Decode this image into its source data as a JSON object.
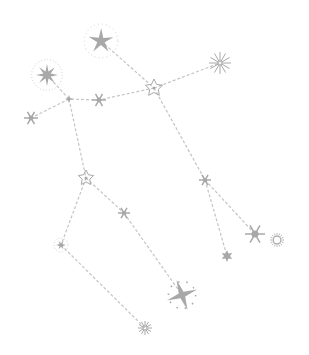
{
  "diagram": {
    "title": "",
    "colors": {
      "background": "#ffffff",
      "star": "#a8a8a8",
      "line": "#c4c4c4",
      "faint": "#d0d0d0"
    },
    "stars": [
      {
        "id": "s1",
        "x": 101,
        "y": 41,
        "r": 13,
        "type": "burst4"
      },
      {
        "id": "s2",
        "x": 47,
        "y": 75,
        "r": 11,
        "type": "burst8glow"
      },
      {
        "id": "s3",
        "x": 69,
        "y": 99,
        "r": 4,
        "type": "dot"
      },
      {
        "id": "s4",
        "x": 99,
        "y": 100,
        "r": 7,
        "type": "flake"
      },
      {
        "id": "s5",
        "x": 31,
        "y": 118,
        "r": 7,
        "type": "flake"
      },
      {
        "id": "s6",
        "x": 154,
        "y": 88,
        "r": 9,
        "type": "outline"
      },
      {
        "id": "s7",
        "x": 220,
        "y": 63,
        "r": 11,
        "type": "rays"
      },
      {
        "id": "s8",
        "x": 205,
        "y": 180,
        "r": 6,
        "type": "flake"
      },
      {
        "id": "s9",
        "x": 86,
        "y": 178,
        "r": 8,
        "type": "outline"
      },
      {
        "id": "s10",
        "x": 124,
        "y": 213,
        "r": 6,
        "type": "flake"
      },
      {
        "id": "s11",
        "x": 61,
        "y": 245,
        "r": 7,
        "type": "dotted"
      },
      {
        "id": "s12",
        "x": 255,
        "y": 234,
        "r": 10,
        "type": "flake"
      },
      {
        "id": "s13",
        "x": 277,
        "y": 240,
        "r": 7,
        "type": "sun"
      },
      {
        "id": "s14",
        "x": 227,
        "y": 256,
        "r": 6,
        "type": "burst6"
      },
      {
        "id": "s15",
        "x": 182,
        "y": 295,
        "r": 16,
        "type": "burst4big"
      },
      {
        "id": "s16",
        "x": 145,
        "y": 328,
        "r": 7,
        "type": "rays"
      }
    ],
    "lines": [
      [
        "s1",
        "s6"
      ],
      [
        "s6",
        "s7"
      ],
      [
        "s6",
        "s4"
      ],
      [
        "s4",
        "s3"
      ],
      [
        "s3",
        "s2"
      ],
      [
        "s3",
        "s5"
      ],
      [
        "s3",
        "s9"
      ],
      [
        "s9",
        "s10"
      ],
      [
        "s10",
        "s15"
      ],
      [
        "s9",
        "s11"
      ],
      [
        "s11",
        "s16"
      ],
      [
        "s6",
        "s8"
      ],
      [
        "s8",
        "s12"
      ],
      [
        "s8",
        "s14"
      ]
    ]
  }
}
